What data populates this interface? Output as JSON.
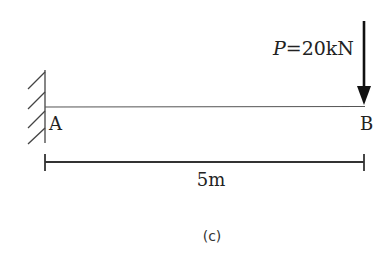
{
  "diagram": {
    "type": "cantilever-beam",
    "support": {
      "label": "A",
      "type": "fixed-wall"
    },
    "free_end": {
      "label": "B"
    },
    "load": {
      "symbol": "P",
      "equals": "=",
      "value": "20kN",
      "direction": "down"
    },
    "span": {
      "label": "5m"
    },
    "caption": "(c)"
  }
}
